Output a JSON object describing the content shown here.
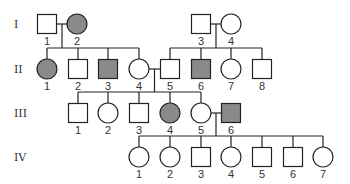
{
  "colors": {
    "line": "#222222",
    "affected": "#8a8a8a",
    "unaffected": "#ffffff"
  },
  "generations": [
    {
      "label": "I",
      "y": 24
    },
    {
      "label": "II",
      "y": 69
    },
    {
      "label": "III",
      "y": 113
    },
    {
      "label": "IV",
      "y": 157
    }
  ],
  "individuals": [
    {
      "gen": "I",
      "id": "1",
      "sex": "male",
      "affected": false,
      "x": 47,
      "y": 24
    },
    {
      "gen": "I",
      "id": "2",
      "sex": "female",
      "affected": true,
      "x": 77,
      "y": 24
    },
    {
      "gen": "I",
      "id": "3",
      "sex": "male",
      "affected": false,
      "x": 201,
      "y": 24
    },
    {
      "gen": "I",
      "id": "4",
      "sex": "female",
      "affected": false,
      "x": 231,
      "y": 24
    },
    {
      "gen": "II",
      "id": "1",
      "sex": "female",
      "affected": true,
      "x": 47,
      "y": 69
    },
    {
      "gen": "II",
      "id": "2",
      "sex": "male",
      "affected": false,
      "x": 78,
      "y": 69
    },
    {
      "gen": "II",
      "id": "3",
      "sex": "male",
      "affected": true,
      "x": 108,
      "y": 69
    },
    {
      "gen": "II",
      "id": "4",
      "sex": "female",
      "affected": false,
      "x": 139,
      "y": 69
    },
    {
      "gen": "II",
      "id": "5",
      "sex": "male",
      "affected": false,
      "x": 170,
      "y": 69
    },
    {
      "gen": "II",
      "id": "6",
      "sex": "male",
      "affected": true,
      "x": 201,
      "y": 69
    },
    {
      "gen": "II",
      "id": "7",
      "sex": "female",
      "affected": false,
      "x": 231,
      "y": 69
    },
    {
      "gen": "II",
      "id": "8",
      "sex": "male",
      "affected": false,
      "x": 262,
      "y": 69
    },
    {
      "gen": "III",
      "id": "1",
      "sex": "male",
      "affected": false,
      "x": 78,
      "y": 113
    },
    {
      "gen": "III",
      "id": "2",
      "sex": "female",
      "affected": false,
      "x": 108,
      "y": 113
    },
    {
      "gen": "III",
      "id": "3",
      "sex": "male",
      "affected": false,
      "x": 139,
      "y": 113
    },
    {
      "gen": "III",
      "id": "4",
      "sex": "female",
      "affected": true,
      "x": 170,
      "y": 113
    },
    {
      "gen": "III",
      "id": "5",
      "sex": "female",
      "affected": false,
      "x": 201,
      "y": 113
    },
    {
      "gen": "III",
      "id": "6",
      "sex": "male",
      "affected": true,
      "x": 231,
      "y": 113
    },
    {
      "gen": "IV",
      "id": "1",
      "sex": "female",
      "affected": false,
      "x": 139,
      "y": 157
    },
    {
      "gen": "IV",
      "id": "2",
      "sex": "female",
      "affected": false,
      "x": 170,
      "y": 157
    },
    {
      "gen": "IV",
      "id": "3",
      "sex": "male",
      "affected": false,
      "x": 201,
      "y": 157
    },
    {
      "gen": "IV",
      "id": "4",
      "sex": "female",
      "affected": false,
      "x": 231,
      "y": 157
    },
    {
      "gen": "IV",
      "id": "5",
      "sex": "male",
      "affected": false,
      "x": 262,
      "y": 157
    },
    {
      "gen": "IV",
      "id": "6",
      "sex": "male",
      "affected": false,
      "x": 293,
      "y": 157
    },
    {
      "gen": "IV",
      "id": "7",
      "sex": "female",
      "affected": false,
      "x": 323,
      "y": 157
    }
  ],
  "matings": [
    {
      "partners": [
        "I-1",
        "I-2"
      ],
      "children": [
        "II-1",
        "II-2",
        "II-3",
        "II-4"
      ]
    },
    {
      "partners": [
        "I-3",
        "I-4"
      ],
      "children": [
        "II-5",
        "II-6",
        "II-7",
        "II-8"
      ]
    },
    {
      "partners": [
        "II-4",
        "II-5"
      ],
      "children": [
        "III-1",
        "III-2",
        "III-3",
        "III-4",
        "III-5"
      ]
    },
    {
      "partners": [
        "III-5",
        "III-6"
      ],
      "children": [
        "IV-1",
        "IV-2",
        "IV-3",
        "IV-4",
        "IV-5",
        "IV-6",
        "IV-7"
      ]
    }
  ]
}
